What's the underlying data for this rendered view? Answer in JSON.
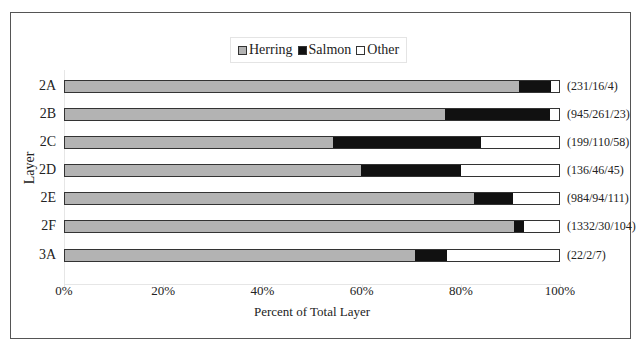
{
  "chart_data": {
    "type": "bar",
    "orientation": "horizontal",
    "stacked": "percent",
    "title": "",
    "xlabel": "Percent of Total Layer",
    "ylabel": "Layer",
    "xlim": [
      0,
      100
    ],
    "x_ticks": [
      "0%",
      "20%",
      "40%",
      "60%",
      "80%",
      "100%"
    ],
    "grid": false,
    "legend_position": "top",
    "categories": [
      "2A",
      "2B",
      "2C",
      "2D",
      "2E",
      "2F",
      "3A"
    ],
    "series": [
      {
        "name": "Herring",
        "color": "#b3b3b3",
        "counts": [
          231,
          945,
          199,
          136,
          984,
          1332,
          22
        ],
        "values": [
          92.0,
          76.9,
          54.2,
          59.9,
          82.8,
          90.9,
          71.0
        ]
      },
      {
        "name": "Salmon",
        "color": "#111111",
        "counts": [
          16,
          261,
          110,
          46,
          94,
          30,
          2
        ],
        "values": [
          6.4,
          21.2,
          30.0,
          20.3,
          7.9,
          2.0,
          6.5
        ]
      },
      {
        "name": "Other",
        "color": "#ffffff",
        "counts": [
          4,
          23,
          58,
          45,
          111,
          104,
          7
        ],
        "values": [
          1.6,
          1.9,
          15.8,
          19.8,
          9.3,
          7.1,
          22.6
        ]
      }
    ],
    "annotations": [
      "(231/16/4)",
      "(945/261/23)",
      "(199/110/58)",
      "(136/46/45)",
      "(984/94/111)",
      "(1332/30/104)",
      "(22/2/7)"
    ]
  },
  "legend": {
    "items": [
      {
        "label": "Herring",
        "color": "#b3b3b3"
      },
      {
        "label": "Salmon",
        "color": "#111111"
      },
      {
        "label": "Other",
        "color": "#ffffff"
      }
    ]
  },
  "axes": {
    "ylabel": "Layer",
    "xlabel": "Percent of Total Layer",
    "x_ticks": [
      "0%",
      "20%",
      "40%",
      "60%",
      "80%",
      "100%"
    ]
  }
}
